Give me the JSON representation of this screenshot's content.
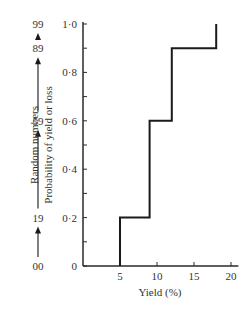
{
  "chart_data": {
    "type": "line",
    "subtype": "cumulative-step",
    "title": "",
    "xlabel": "Yield (%)",
    "ylabel": "Probability of yield or loss",
    "secondary_ylabel": "Random numbers",
    "xlim": [
      0,
      21
    ],
    "ylim": [
      0,
      1.0
    ],
    "x_ticks": [
      5,
      10,
      15,
      20
    ],
    "x_tick_labels": [
      "5",
      "10",
      "15",
      "20"
    ],
    "y_ticks": [
      0,
      0.1,
      0.2,
      0.3,
      0.4,
      0.5,
      0.6,
      0.7,
      0.8,
      0.9,
      1.0
    ],
    "y_tick_labels": {
      "0": "0",
      "0.2": "0·2",
      "0.4": "0·4",
      "0.6": "0·6",
      "0.8": "0·8",
      "1.0": "1·0"
    },
    "grid": false,
    "series": [
      {
        "name": "Cumulative probability",
        "steps": [
          {
            "x_start": 5,
            "x_end": 9,
            "y": 0.2
          },
          {
            "x_start": 9,
            "x_end": 12,
            "y": 0.6
          },
          {
            "x_start": 12,
            "x_end": 18,
            "y": 0.9
          },
          {
            "x_start": 18,
            "x_end": 18,
            "y": 1.0
          }
        ],
        "x": [
          5,
          5,
          9,
          9,
          12,
          12,
          18,
          18
        ],
        "y": [
          0,
          0.2,
          0.2,
          0.6,
          0.6,
          0.9,
          0.9,
          1.0
        ]
      }
    ],
    "random_number_scale": {
      "labels": [
        "00",
        "19",
        "59",
        "89",
        "99"
      ],
      "positions": [
        0,
        0.2,
        0.6,
        0.9,
        1.0
      ]
    }
  }
}
